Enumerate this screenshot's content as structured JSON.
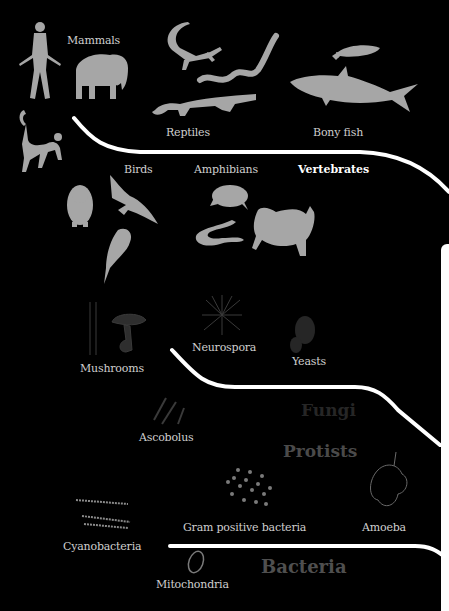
{
  "diagram": {
    "background": "#000000",
    "silhouette_color": "#a6a6a6",
    "branch_color": "#ffffff"
  },
  "groups": {
    "vertebrates": "Vertebrates",
    "fungi": "Fungi",
    "protists": "Protists",
    "bacteria": "Bacteria"
  },
  "labels": {
    "mammals": "Mammals",
    "reptiles": "Reptiles",
    "bony_fish": "Bony fish",
    "birds": "Birds",
    "amphibians": "Amphibians",
    "mushrooms": "Mushrooms",
    "neurospora": "Neurospora",
    "yeasts": "Yeasts",
    "ascobolus": "Ascobolus",
    "gram_positive_bacteria": "Gram positive bacteria",
    "amoeba": "Amoeba",
    "cyanobacteria": "Cyanobacteria",
    "mitochondria": "Mitochondria"
  },
  "icons": [
    "human-icon",
    "elephant-icon",
    "monkey-icon",
    "lizard-icon",
    "snake-icon",
    "crocodile-icon",
    "fish-icon",
    "shark-icon",
    "penguin-icon",
    "eagle-icon",
    "songbird-icon",
    "frog-icon",
    "salamander-icon",
    "toad-icon",
    "mushroom-icon",
    "neurospora-icon",
    "yeast-icon",
    "ascobolus-icon",
    "bacteria-cluster-icon",
    "amoeba-icon",
    "cyanobacteria-icon",
    "mitochondria-icon"
  ]
}
